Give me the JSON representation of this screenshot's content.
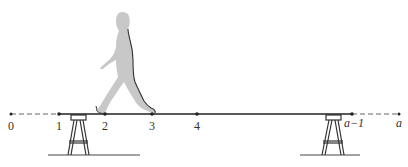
{
  "figure": {
    "colors": {
      "line": "#222222",
      "dashed": "#555555",
      "figure_fill": "#c8c8c8",
      "figure_outline": "#333333",
      "background": "#ffffff"
    },
    "number_line": {
      "points": [
        {
          "label": "0",
          "x": 11,
          "italic": false
        },
        {
          "label": "1",
          "x": 59,
          "italic": false
        },
        {
          "label": "2",
          "x": 105,
          "italic": false
        },
        {
          "label": "3",
          "x": 152,
          "italic": false
        },
        {
          "label": "4",
          "x": 197,
          "italic": false
        },
        {
          "label": "a−1",
          "x": 352,
          "italic": true
        },
        {
          "label": "a",
          "x": 399,
          "italic": true
        }
      ],
      "dashed_segments": [
        [
          "0",
          "1"
        ],
        [
          "a−1",
          "a"
        ]
      ],
      "solid_segment": [
        "1",
        "a−1"
      ]
    },
    "supports": [
      {
        "name": "left-sawhorse",
        "center_x": 78
      },
      {
        "name": "right-sawhorse",
        "center_x": 333
      }
    ]
  }
}
